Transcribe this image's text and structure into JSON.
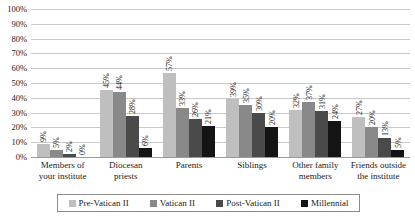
{
  "chart_data": {
    "type": "bar",
    "title": "",
    "xlabel": "",
    "ylabel": "",
    "ylim": [
      0,
      100
    ],
    "ytick_labels": [
      "100%",
      "90%",
      "80%",
      "70%",
      "60%",
      "50%",
      "40%",
      "30%",
      "20%",
      "10%",
      "0%"
    ],
    "ytick_values": [
      100,
      90,
      80,
      70,
      60,
      50,
      40,
      30,
      20,
      10,
      0
    ],
    "grid": true,
    "legend_position": "bottom",
    "value_label_suffix": "%",
    "categories": [
      "Members of your institute",
      "Diocesan priests",
      "Parents",
      "Siblings",
      "Other family members",
      "Friends outside the institute"
    ],
    "category_lines": [
      [
        "Members of",
        "your institute"
      ],
      [
        "Diocesan",
        "priests"
      ],
      [
        "Parents"
      ],
      [
        "Siblings"
      ],
      [
        "Other family",
        "members"
      ],
      [
        "Friends outside",
        "the institute"
      ]
    ],
    "series": [
      {
        "name": "Pre-Vatican II",
        "color": "#bfbfbf",
        "values": [
          9,
          45,
          57,
          39,
          32,
          27
        ],
        "labels": [
          "9%",
          "45%",
          "57%",
          "39%",
          "32%",
          "27%"
        ]
      },
      {
        "name": "Vatican II",
        "color": "#898989",
        "values": [
          5,
          44,
          33,
          35,
          37,
          20
        ],
        "labels": [
          "5%",
          "44%",
          "33%",
          "35%",
          "37%",
          "20%"
        ]
      },
      {
        "name": "Post-Vatican II",
        "color": "#4a4a4a",
        "values": [
          2,
          28,
          26,
          30,
          31,
          13
        ],
        "labels": [
          "2%",
          "28%",
          "26%",
          "30%",
          "31%",
          "13%"
        ]
      },
      {
        "name": "Millennial",
        "color": "#141414",
        "values": [
          0,
          6,
          21,
          20,
          24,
          5
        ],
        "labels": [
          "0%",
          "6%",
          "21%",
          "20%",
          "24%",
          "5%"
        ]
      }
    ]
  }
}
